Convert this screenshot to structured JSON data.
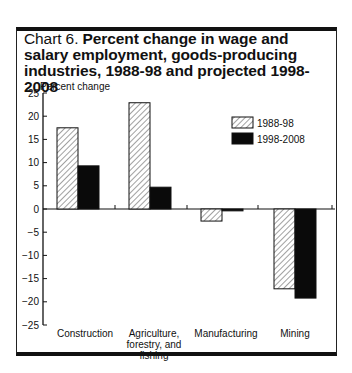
{
  "title": {
    "prefix": "Chart 6. ",
    "main": "Percent change in wage and salary employment, goods-producing industries, 1988-98 and projected 1998-2008"
  },
  "axis": {
    "ylabel": "Percent change",
    "ticks": [
      "25",
      "20",
      "15",
      "10",
      "5",
      "0",
      "-5",
      "-10",
      "-15",
      "-20",
      "-25"
    ]
  },
  "legend": {
    "items": [
      {
        "label": "1988-98",
        "style": "hatched"
      },
      {
        "label": "1998-2008",
        "style": "solid-black"
      }
    ]
  },
  "categories": {
    "c0": "Construction",
    "c1": "Agriculture, forestry, and fishing",
    "c2": "Manufacturing",
    "c3": "Mining"
  },
  "colors": {
    "series1_fill": "#ffffff",
    "series1_hatch": "#333333",
    "series2_fill": "#0a0a0a",
    "frame": "#111111"
  },
  "chart_data": {
    "type": "bar",
    "title": "Chart 6. Percent change in wage and salary employment, goods-producing industries, 1988-98 and projected 1998-2008",
    "xlabel": "",
    "ylabel": "Percent change",
    "categories": [
      "Construction",
      "Agriculture, forestry, and fishing",
      "Manufacturing",
      "Mining"
    ],
    "series": [
      {
        "name": "1988-98",
        "values": [
          17.5,
          22.9,
          -2.6,
          -17.2
        ]
      },
      {
        "name": "1998-2008",
        "values": [
          9.3,
          4.7,
          -0.4,
          -19.2
        ]
      }
    ],
    "ylim": [
      -25,
      25
    ],
    "yticks": [
      -25,
      -20,
      -15,
      -10,
      -5,
      0,
      5,
      10,
      15,
      20,
      25
    ],
    "grid": false,
    "legend_position": "upper right"
  }
}
